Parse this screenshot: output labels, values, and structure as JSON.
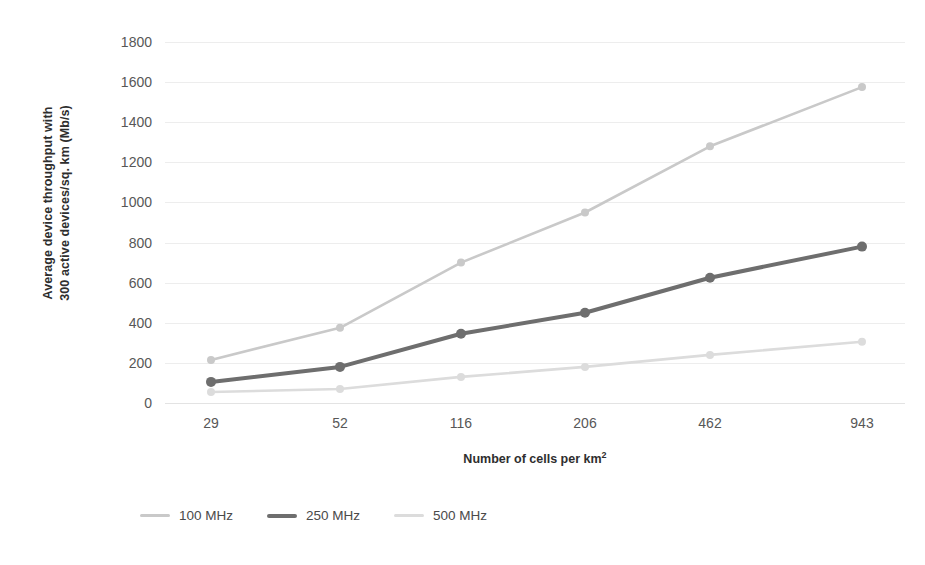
{
  "chart_data": {
    "type": "line",
    "title": "",
    "xlabel": "Number of cells per km²",
    "ylabel_line1": "Average device throughput with",
    "ylabel_line2": "300 active devices/sq. km (Mb/s)",
    "categories": [
      "29",
      "52",
      "116",
      "206",
      "462",
      "943"
    ],
    "ylim": [
      0,
      1800
    ],
    "ytick_values": [
      0,
      200,
      400,
      600,
      800,
      1000,
      1200,
      1400,
      1600,
      1800
    ],
    "ytick_labels": [
      "0",
      "200",
      "400",
      "600",
      "800",
      "1000",
      "1200",
      "1400",
      "1600",
      "1800"
    ],
    "grid": true,
    "legend_position": "bottom-left",
    "series": [
      {
        "name": "100 MHz",
        "color": "#c9c9c9",
        "line_width": 2.6,
        "marker": "circle",
        "marker_size": 8,
        "values": [
          215,
          375,
          700,
          950,
          1280,
          1575
        ]
      },
      {
        "name": "250 MHz",
        "color": "#6e6e6e",
        "line_width": 4,
        "marker": "circle",
        "marker_size": 10,
        "values": [
          105,
          180,
          345,
          450,
          625,
          780
        ]
      },
      {
        "name": "500 MHz",
        "color": "#dcdcdc",
        "line_width": 2.6,
        "marker": "circle",
        "marker_size": 8,
        "values": [
          55,
          70,
          130,
          180,
          240,
          305
        ]
      }
    ]
  },
  "legend": {
    "items": [
      {
        "label": "100 MHz",
        "color": "#c9c9c9",
        "thickness": "3px"
      },
      {
        "label": "250 MHz",
        "color": "#6e6e6e",
        "thickness": "4px"
      },
      {
        "label": "500 MHz",
        "color": "#dcdcdc",
        "thickness": "3px"
      }
    ]
  }
}
